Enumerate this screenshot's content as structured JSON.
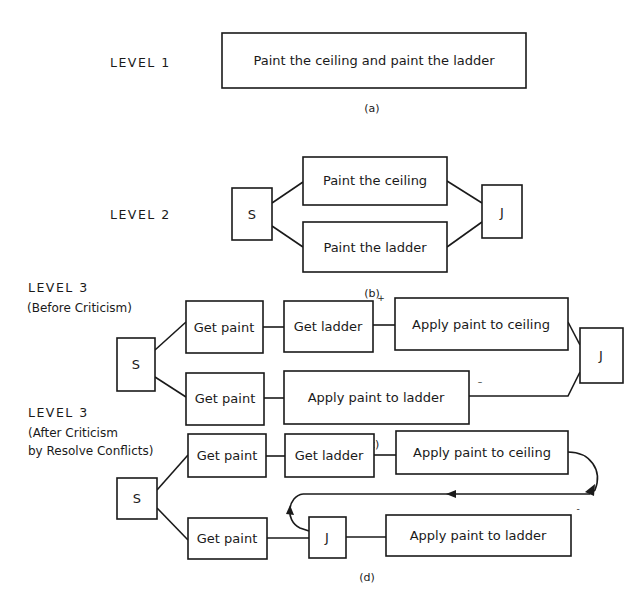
{
  "panel_a": {
    "level": "LEVEL 1",
    "caption": "(a)",
    "node": "Paint the ceiling and paint the ladder"
  },
  "panel_b": {
    "level": "LEVEL 2",
    "caption": "(b)",
    "split": "S",
    "join": "J",
    "top": "Paint the ceiling",
    "bottom": "Paint the ladder"
  },
  "panel_c": {
    "level": "LEVEL 3",
    "subtitle": "(Before Criticism)",
    "caption": "(c)",
    "split": "S",
    "join": "J",
    "top": [
      "Get paint",
      "Get ladder",
      "Apply paint to ceiling"
    ],
    "bottom": [
      "Get paint",
      "Apply paint to ladder"
    ],
    "plus_mark": "+",
    "minus_mark": "–"
  },
  "panel_d": {
    "level": "LEVEL 3",
    "subtitle_line1": "(After Criticism",
    "subtitle_line2": "by Resolve Conflicts)",
    "caption": "(d)",
    "split": "S",
    "join": "J",
    "top": [
      "Get paint",
      "Get ladder",
      "Apply paint to ceiling"
    ],
    "bottom_first": "Get paint",
    "bottom_last": "Apply paint to ladder",
    "minus_mark": "-"
  }
}
